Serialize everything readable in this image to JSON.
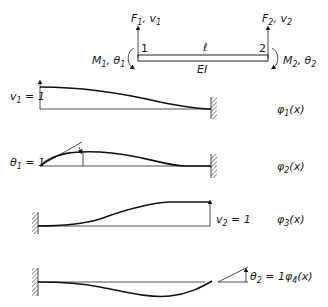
{
  "beam_element": {
    "node1_label": "1",
    "node2_label": "2",
    "length_label": "ℓ",
    "stiffness_label": "EI",
    "left_force": {
      "F": "F",
      "sub": "1",
      "sep": ", ",
      "v": "v",
      "vsub": "1"
    },
    "right_force": {
      "F": "F",
      "sub": "2",
      "sep": ", ",
      "v": "v",
      "vsub": "2"
    },
    "left_moment": {
      "M": "M",
      "sub": "1",
      "sep": ", ",
      "t": "θ",
      "tsub": "1"
    },
    "right_moment": {
      "M": "M",
      "sub": "2",
      "sep": ", ",
      "t": "θ",
      "tsub": "2"
    }
  },
  "shape_functions": [
    {
      "name": "φ",
      "sub": "1",
      "arg": "(x)",
      "condition": {
        "sym": "v",
        "sub": "1",
        "eq": " = 1"
      },
      "support": "right"
    },
    {
      "name": "φ",
      "sub": "2",
      "arg": "(x)",
      "condition": {
        "sym": "θ",
        "sub": "1",
        "eq": " = 1"
      },
      "support": "right"
    },
    {
      "name": "φ",
      "sub": "3",
      "arg": "(x)",
      "condition": {
        "sym": "v",
        "sub": "2",
        "eq": " = 1"
      },
      "support": "left"
    },
    {
      "name": "φ",
      "sub": "4",
      "arg": "(x)",
      "condition": {
        "sym": "θ",
        "sub": "2",
        "eq": " = 1"
      },
      "support": "left"
    }
  ]
}
